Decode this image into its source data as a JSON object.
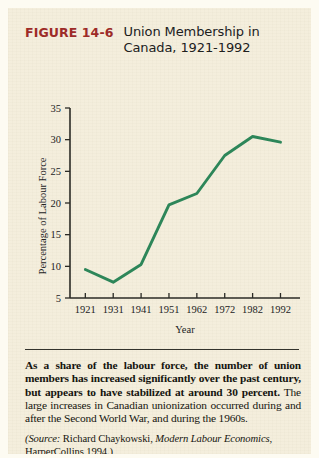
{
  "figure": {
    "number": "FIGURE 14-6",
    "title_line1": "Union Membership in",
    "title_line2": "Canada, 1921-1992",
    "number_color": "#9d2b28"
  },
  "chart_data": {
    "type": "line",
    "title": "Union Membership in Canada, 1921-1992",
    "xlabel": "Year",
    "ylabel": "Percentage of Labour Force",
    "categories": [
      "1921",
      "1931",
      "1941",
      "1951",
      "1962",
      "1972",
      "1982",
      "1992"
    ],
    "values": [
      9.5,
      7.5,
      10.3,
      19.7,
      21.5,
      27.5,
      30.5,
      29.6
    ],
    "ylim": [
      5,
      35
    ],
    "ytick_labels": [
      "5",
      "10",
      "15",
      "20",
      "25",
      "30",
      "35"
    ],
    "yticks": [
      5,
      10,
      15,
      20,
      25,
      30,
      35
    ],
    "grid": false,
    "legend": "none",
    "line_color": "#2d8659"
  },
  "caption": {
    "lead": "As a share of the labour force, the number of union members has increased significantly over the past century, but appears to have stabilized at around 30 percent.",
    "rest": " The large increases in Canadian unionization occurred during and after the Second World War, and during the 1960s.",
    "source_prefix": "(Source:",
    "source_author": " Richard Chaykowski, ",
    "source_work": "Modern Labour Economics",
    "source_publisher": ", HarperCollins 1994.)"
  }
}
